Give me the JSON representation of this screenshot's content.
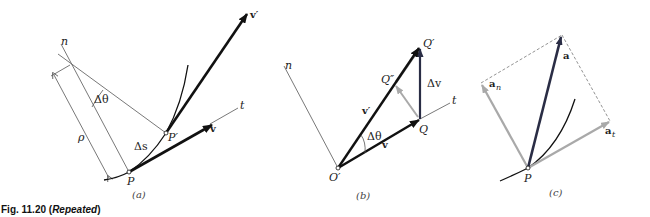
{
  "figure": {
    "caption_number": "Fig. 11.20",
    "caption_open": " (",
    "caption_note": "Repeated",
    "caption_close": ")"
  },
  "panels": [
    {
      "id": "a",
      "panel_label": "(a)",
      "labels": {
        "normal_axis": "n",
        "tangent_axis": "t",
        "angle": "Δθ",
        "radius": "ρ",
        "arc_length": "Δs",
        "point_p": "P",
        "point_p_prime": "P′",
        "velocity": "v",
        "velocity_prime": "v′"
      }
    },
    {
      "id": "b",
      "panel_label": "(b)",
      "labels": {
        "normal_axis": "n",
        "tangent_axis": "t",
        "origin": "O′",
        "point_q": "Q",
        "point_q_prime": "Q′",
        "point_q_double_prime": "Q″",
        "delta_v": "Δv",
        "velocity": "v",
        "velocity_prime": "v′",
        "angle": "Δθ"
      }
    },
    {
      "id": "c",
      "panel_label": "(c)",
      "labels": {
        "point_p": "P",
        "acceleration": "a",
        "normal_component_base": "a",
        "normal_component_sub": "n",
        "tangential_component_base": "a",
        "tangential_component_sub": "t"
      }
    }
  ],
  "colors": {
    "dark_vector": "#111111",
    "navy_vector": "#2a2d45",
    "gray_vector": "#a9a9a9",
    "thin_line": "#555555",
    "dashed": "#777777"
  }
}
